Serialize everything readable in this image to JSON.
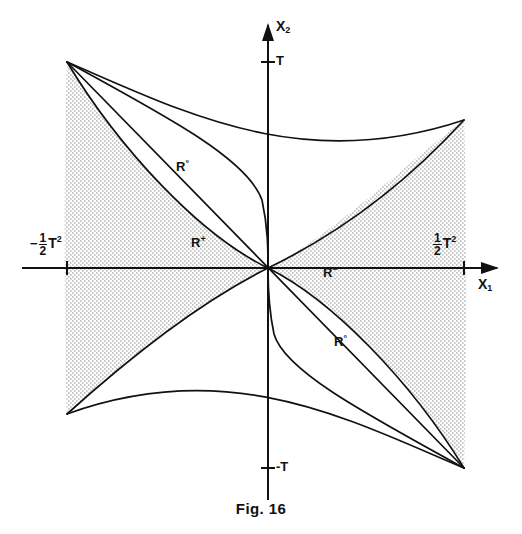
{
  "figure": {
    "caption": "Fig. 16",
    "caption_top_px": 500
  },
  "axes": {
    "x_axis": {
      "name": "X",
      "subscript": "1",
      "label_left_px": 478,
      "label_top_px": 276,
      "y_px": 268,
      "x_start_px": 22,
      "x_end_px": 500
    },
    "y_axis": {
      "name": "X",
      "subscript": "2",
      "label_left_px": 276,
      "label_top_px": 18,
      "x_px": 268,
      "y_start_px": 22,
      "y_end_px": 500
    }
  },
  "ticks": [
    {
      "id": "tick-t-positive",
      "text": "T",
      "axis": "y",
      "x_px": 268,
      "y_px": 62,
      "label_left_px": 276,
      "label_top_px": 53
    },
    {
      "id": "tick-t-negative",
      "text": "-T",
      "axis": "y",
      "x_px": 268,
      "y_px": 468,
      "label_left_px": 276,
      "label_top_px": 459
    },
    {
      "id": "tick-half-t-squared-negative",
      "sign": "−",
      "numerator": "1",
      "denominator": "2",
      "symbol": "T",
      "exponent": "2",
      "axis": "x",
      "x_px": 67,
      "y_px": 268,
      "label_left_px": 30,
      "label_top_px": 232
    },
    {
      "id": "tick-half-t-squared-positive",
      "sign": "",
      "numerator": "1",
      "denominator": "2",
      "symbol": "T",
      "exponent": "2",
      "axis": "x",
      "x_px": 464,
      "y_px": 268,
      "label_left_px": 432,
      "label_top_px": 232
    }
  ],
  "region_labels": [
    {
      "id": "region-r-zero-upper",
      "base": "R",
      "sup": "°",
      "left_px": 176,
      "top_px": 158
    },
    {
      "id": "region-r-plus",
      "base": "R",
      "sup": "+",
      "left_px": 191,
      "top_px": 234
    },
    {
      "id": "region-r-minus",
      "base": "R",
      "sup": "−",
      "left_px": 323,
      "top_px": 264
    },
    {
      "id": "region-r-zero-lower",
      "base": "R",
      "sup": "°",
      "left_px": 334,
      "top_px": 333
    }
  ],
  "chart_data": {
    "type": "line",
    "title": "Fig. 16",
    "xlabel": "X1",
    "ylabel": "X2",
    "grid": false,
    "legend": "none",
    "xlim": [
      "-1/2 T^2",
      "1/2 T^2"
    ],
    "ylim": [
      "-T",
      "T"
    ],
    "origin_px": {
      "x": 268,
      "y": 268
    },
    "axis_tick_values_px": {
      "x_neg_half_t_squared": 67,
      "x_pos_half_t_squared": 464,
      "y_pos_T": 62,
      "y_neg_T": 468
    },
    "cusps_px": [
      {
        "name": "upper-left-cusp",
        "x": 67,
        "y": 62
      },
      {
        "name": "lower-right-cusp",
        "x": 464,
        "y": 468
      }
    ],
    "curves": [
      {
        "name": "outer-upper-left-boundary",
        "role": "straight chord from upper-left cusp to lower-right cusp",
        "points_px": [
          [
            67,
            62
          ],
          [
            464,
            468
          ]
        ]
      },
      {
        "name": "upper-lobe-inner-parabola",
        "role": "parabolic arc through origin, upper lobe",
        "points_px": [
          [
            67,
            62
          ],
          [
            140,
            140
          ],
          [
            205,
            210
          ],
          [
            250,
            252
          ],
          [
            268,
            268
          ]
        ]
      },
      {
        "name": "upper-lobe-outer-parabola",
        "role": "parabolic arc from origin to right cusp region",
        "points_px": [
          [
            268,
            268
          ],
          [
            320,
            238
          ],
          [
            380,
            205
          ],
          [
            440,
            152
          ],
          [
            464,
            120
          ]
        ]
      },
      {
        "name": "lower-lobe-inner-parabola",
        "role": "parabolic arc through origin, lower lobe",
        "points_px": [
          [
            464,
            468
          ],
          [
            392,
            392
          ],
          [
            330,
            325
          ],
          [
            288,
            286
          ],
          [
            268,
            268
          ]
        ]
      },
      {
        "name": "lower-lobe-outer-parabola",
        "role": "parabolic arc from origin to left cusp region",
        "points_px": [
          [
            268,
            268
          ],
          [
            214,
            298
          ],
          [
            152,
            330
          ],
          [
            94,
            382
          ],
          [
            67,
            414
          ]
        ]
      },
      {
        "name": "steep-branch-upper",
        "role": "steep parabolic branch hitting Y axis near y=180",
        "points_px": [
          [
            67,
            62
          ],
          [
            160,
            110
          ],
          [
            230,
            150
          ],
          [
            262,
            198
          ],
          [
            268,
            268
          ]
        ]
      },
      {
        "name": "steep-branch-lower",
        "role": "steep parabolic branch hitting Y axis near y=356",
        "points_px": [
          [
            464,
            468
          ],
          [
            372,
            420
          ],
          [
            305,
            380
          ],
          [
            274,
            338
          ],
          [
            268,
            268
          ]
        ]
      }
    ],
    "shaded_regions": [
      {
        "name": "R-plus-band",
        "fill": "stipple",
        "label": "R+"
      },
      {
        "name": "R-minus-band",
        "fill": "stipple",
        "label": "R-"
      }
    ]
  },
  "style": {
    "stroke_color": "#111111",
    "background": "#ffffff",
    "stipple_color": "#6f6f6f"
  }
}
